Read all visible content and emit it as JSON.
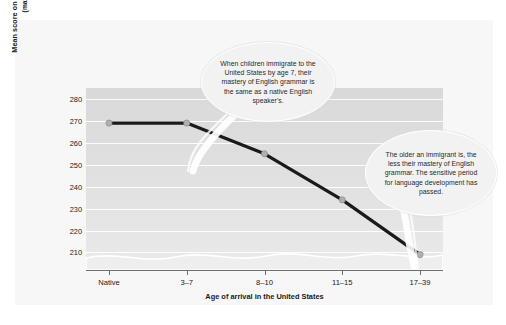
{
  "chart_data": {
    "type": "line",
    "title": "",
    "xlabel": "Age of arrival in the United States",
    "ylabel": "Mean score on test of English grammar",
    "ylabel_sub": "(max score = 276)",
    "categories": [
      "Native",
      "3–7",
      "8–10",
      "11–15",
      "17–39"
    ],
    "values": [
      269,
      269,
      255,
      234,
      209
    ],
    "series": [
      {
        "name": "Mean score on test of English grammar",
        "values": [
          269,
          269,
          255,
          234,
          209
        ]
      }
    ],
    "ytick_labels": [
      "280",
      "270",
      "260",
      "250",
      "240",
      "230",
      "220",
      "210"
    ],
    "ytick_values": [
      280,
      270,
      260,
      250,
      240,
      230,
      220,
      210
    ],
    "ylim": [
      202,
      285
    ],
    "grid": true,
    "legend": "none",
    "axis_break": true,
    "line_color": "#1a1a1a",
    "marker_color": "#b0b0b0",
    "plot_background": "#d9d9d9",
    "gridline_color": "#ffffff",
    "card_background": "#f7f7f7",
    "annotations": [
      {
        "id": "callout-1",
        "text": "When children immigrate to the United States by age 7, their mastery of English grammar is the same as a native English speaker's.",
        "points_to": "3–7"
      },
      {
        "id": "callout-2",
        "text": "The older an immigrant is, the less their mastery of English grammar. The sensitive period for language development has passed.",
        "points_to": "17–39"
      }
    ]
  }
}
